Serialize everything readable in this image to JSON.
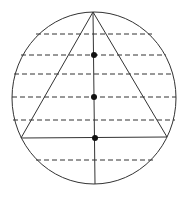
{
  "diagram": {
    "canvas": {
      "width": 189,
      "height": 199,
      "background": "#ffffff"
    },
    "stroke_color": "#333333",
    "dot_color": "#111111",
    "circle": {
      "cx": 94,
      "cy": 98,
      "rx": 82,
      "ry": 86
    },
    "triangle": {
      "apex": [
        93,
        12
      ],
      "left": [
        21,
        138
      ],
      "right": [
        167,
        137
      ]
    },
    "median": {
      "x1": 93,
      "y1": 12,
      "x2": 95,
      "y2": 184
    },
    "dashed_chords": [
      {
        "y": 34,
        "x1": 36,
        "x2": 152
      },
      {
        "y": 55,
        "x1": 21,
        "x2": 166
      },
      {
        "y": 74,
        "x1": 14,
        "x2": 173
      },
      {
        "y": 97,
        "x1": 12,
        "x2": 176
      },
      {
        "y": 120,
        "x1": 13,
        "x2": 175
      },
      {
        "y": 160,
        "x1": 36,
        "x2": 153
      }
    ],
    "points": [
      {
        "x": 94,
        "y": 55,
        "r": 3
      },
      {
        "x": 94,
        "y": 97,
        "r": 3
      },
      {
        "x": 95,
        "y": 138,
        "r": 3
      }
    ]
  }
}
